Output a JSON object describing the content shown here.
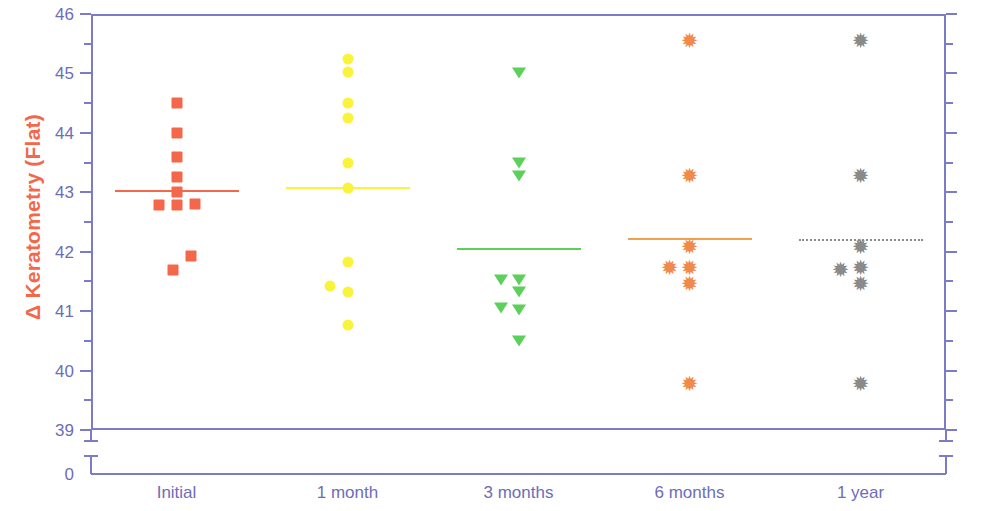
{
  "chart_data": {
    "type": "scatter",
    "title": "",
    "xlabel": "",
    "ylabel": "Δ Keratometry (Flat)",
    "ylim": [
      39,
      46
    ],
    "y_axis_break_label": "0",
    "ytick_labels": [
      "46",
      "45",
      "44",
      "43",
      "42",
      "41",
      "40",
      "39"
    ],
    "ytick_values": [
      46,
      45,
      44,
      43,
      42,
      41,
      40,
      39
    ],
    "minor_ticks": true,
    "grid": false,
    "legend": "none",
    "categories": [
      "Initial",
      "1 month",
      "3 months",
      "6 months",
      "1 year"
    ],
    "series": [
      {
        "name": "Initial",
        "marker": "square",
        "color": "#F4674A",
        "mean": 43.02,
        "mean_line_color": "#F4674A",
        "mean_line_style": "solid",
        "points": [
          {
            "value": 44.5,
            "offset": 0
          },
          {
            "value": 44.0,
            "offset": 0
          },
          {
            "value": 43.6,
            "offset": 0
          },
          {
            "value": 43.25,
            "offset": 0
          },
          {
            "value": 43.0,
            "offset": 0
          },
          {
            "value": 42.78,
            "offset": -18
          },
          {
            "value": 42.78,
            "offset": 0
          },
          {
            "value": 42.8,
            "offset": 18
          },
          {
            "value": 41.92,
            "offset": 14
          },
          {
            "value": 41.7,
            "offset": -4
          }
        ]
      },
      {
        "name": "1 month",
        "marker": "circle",
        "color": "#FAF33C",
        "mean": 43.07,
        "mean_line_color": "#FAF33C",
        "mean_line_style": "solid",
        "points": [
          {
            "value": 45.25,
            "offset": 0
          },
          {
            "value": 45.02,
            "offset": 0
          },
          {
            "value": 44.5,
            "offset": 0
          },
          {
            "value": 44.25,
            "offset": 0
          },
          {
            "value": 43.5,
            "offset": 0
          },
          {
            "value": 43.07,
            "offset": 0
          },
          {
            "value": 41.82,
            "offset": 0
          },
          {
            "value": 41.42,
            "offset": -18
          },
          {
            "value": 41.33,
            "offset": 0
          },
          {
            "value": 40.77,
            "offset": 0
          }
        ]
      },
      {
        "name": "3 months",
        "marker": "triangle-down",
        "color": "#5BD05B",
        "mean": 42.05,
        "mean_line_color": "#5BD05B",
        "mean_line_style": "solid",
        "points": [
          {
            "value": 45.0,
            "offset": 0
          },
          {
            "value": 43.5,
            "offset": 0
          },
          {
            "value": 43.28,
            "offset": 0
          },
          {
            "value": 41.52,
            "offset": -18
          },
          {
            "value": 41.52,
            "offset": 0
          },
          {
            "value": 41.33,
            "offset": 0
          },
          {
            "value": 41.05,
            "offset": -18
          },
          {
            "value": 41.02,
            "offset": 0
          },
          {
            "value": 40.5,
            "offset": 0
          }
        ]
      },
      {
        "name": "6 months",
        "marker": "star",
        "color": "#F08A4B",
        "mean": 42.22,
        "mean_line_color": "#F0A24B",
        "mean_line_style": "solid",
        "points": [
          {
            "value": 45.55,
            "offset": 0
          },
          {
            "value": 43.28,
            "offset": 0
          },
          {
            "value": 42.08,
            "offset": 0
          },
          {
            "value": 41.72,
            "offset": -20
          },
          {
            "value": 41.72,
            "offset": 0
          },
          {
            "value": 41.45,
            "offset": 0
          },
          {
            "value": 39.77,
            "offset": 0
          }
        ]
      },
      {
        "name": "1 year",
        "marker": "star",
        "color": "#8A8A8A",
        "mean": 42.2,
        "mean_line_color": "#8A8A8A",
        "mean_line_style": "dotted",
        "points": [
          {
            "value": 45.55,
            "offset": 0
          },
          {
            "value": 43.28,
            "offset": 0
          },
          {
            "value": 42.08,
            "offset": 0
          },
          {
            "value": 41.7,
            "offset": -20
          },
          {
            "value": 41.72,
            "offset": 0
          },
          {
            "value": 41.45,
            "offset": 0
          },
          {
            "value": 39.77,
            "offset": 0
          }
        ]
      }
    ]
  },
  "axis": {
    "frame_color": "#7B7BC8",
    "tick_label_color": "#6D6DB8",
    "ylabel_color": "#F4674A"
  }
}
